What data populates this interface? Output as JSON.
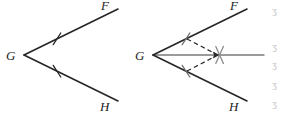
{
  "figure": {
    "stroke_color": "#262626",
    "bisector_color": "#7a7a7a",
    "dashed_color": "#2b2b2b",
    "label_color": "#1d1d1d",
    "artifact_color": "#c9c9c9",
    "background": "#ffffff",
    "panels": [
      {
        "id": "left",
        "name": "given-angle",
        "vertex_label": "G",
        "upper_ray_label": "F",
        "lower_ray_label": "H",
        "vertex": {
          "x": 24,
          "y": 55
        },
        "upper_end": {
          "x": 118,
          "y": 9
        },
        "lower_end": {
          "x": 118,
          "y": 101
        },
        "upper_tick": {
          "x": 57,
          "y": 38.8
        },
        "lower_tick": {
          "x": 57,
          "y": 71.2
        },
        "has_bisector": false,
        "has_dashed_arcs": false,
        "tick_count": 1
      },
      {
        "id": "right",
        "name": "bisected-angle",
        "vertex_label": "G",
        "upper_ray_label": "F",
        "lower_ray_label": "H",
        "vertex": {
          "x": 153,
          "y": 55
        },
        "upper_end": {
          "x": 247,
          "y": 9
        },
        "lower_end": {
          "x": 247,
          "y": 101
        },
        "upper_tick": {
          "x": 186,
          "y": 38.8
        },
        "lower_tick": {
          "x": 186,
          "y": 71.2
        },
        "has_bisector": true,
        "has_dashed_arcs": true,
        "tick_count": 1,
        "bisector_end": {
          "x": 264,
          "y": 55
        },
        "intersection_point": {
          "x": 219,
          "y": 55
        },
        "intersection_mark": "x-cross"
      }
    ],
    "edge_artifacts": [
      "ʒ",
      "ʒ",
      "ʒ",
      "ʒ",
      "ʒ"
    ]
  }
}
